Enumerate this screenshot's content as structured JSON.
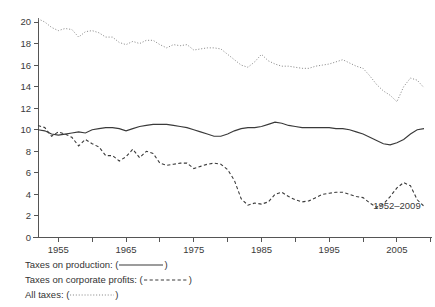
{
  "chart_data": {
    "type": "line",
    "title": "",
    "subtitle": "",
    "xlabel": "",
    "ylabel": "",
    "xlim": [
      1952,
      2009
    ],
    "ylim": [
      0,
      20
    ],
    "xticks": [
      1955,
      1965,
      1975,
      1985,
      1995,
      2005
    ],
    "yticks": [
      0,
      2,
      4,
      6,
      8,
      10,
      12,
      14,
      16,
      18,
      20
    ],
    "grid": false,
    "legend_position": "below-axes-left",
    "annotations": [
      {
        "text": "1952–2009",
        "x": 2005,
        "y": 2.6
      }
    ],
    "x": [
      1952,
      1953,
      1954,
      1955,
      1956,
      1957,
      1958,
      1959,
      1960,
      1961,
      1962,
      1963,
      1964,
      1965,
      1966,
      1967,
      1968,
      1969,
      1970,
      1971,
      1972,
      1973,
      1974,
      1975,
      1976,
      1977,
      1978,
      1979,
      1980,
      1981,
      1982,
      1983,
      1984,
      1985,
      1986,
      1987,
      1988,
      1989,
      1990,
      1991,
      1992,
      1993,
      1994,
      1995,
      1996,
      1997,
      1998,
      1999,
      2000,
      2001,
      2002,
      2003,
      2004,
      2005,
      2006,
      2007,
      2008,
      2009
    ],
    "series": [
      {
        "name": "Taxes on production",
        "style": "solid",
        "values": [
          10.0,
          9.9,
          9.6,
          9.5,
          9.6,
          9.7,
          9.8,
          9.7,
          10.0,
          10.1,
          10.2,
          10.2,
          10.1,
          9.9,
          10.1,
          10.3,
          10.4,
          10.5,
          10.5,
          10.5,
          10.4,
          10.3,
          10.2,
          10.0,
          9.8,
          9.6,
          9.4,
          9.4,
          9.6,
          9.9,
          10.1,
          10.2,
          10.2,
          10.3,
          10.5,
          10.7,
          10.6,
          10.4,
          10.3,
          10.2,
          10.2,
          10.2,
          10.2,
          10.2,
          10.1,
          10.1,
          10.0,
          9.8,
          9.6,
          9.3,
          9.0,
          8.7,
          8.6,
          8.8,
          9.1,
          9.6,
          10.0,
          10.1
        ]
      },
      {
        "name": "Taxes on corporate profits",
        "style": "dashed",
        "values": [
          10.4,
          10.2,
          9.4,
          9.8,
          9.6,
          9.3,
          8.5,
          9.1,
          8.7,
          8.4,
          7.6,
          7.6,
          7.1,
          7.5,
          8.2,
          7.4,
          8.0,
          7.8,
          6.9,
          6.7,
          6.8,
          6.9,
          6.9,
          6.4,
          6.6,
          6.8,
          6.9,
          6.8,
          6.3,
          5.3,
          3.6,
          3.0,
          3.2,
          3.1,
          3.3,
          4.0,
          4.2,
          3.8,
          3.5,
          3.3,
          3.4,
          3.7,
          4.0,
          4.1,
          4.2,
          4.2,
          4.0,
          3.8,
          3.7,
          3.2,
          2.8,
          3.1,
          3.8,
          4.6,
          5.1,
          4.8,
          3.5,
          2.9
        ]
      },
      {
        "name": "All taxes",
        "style": "dotted",
        "values": [
          20.3,
          20.0,
          19.5,
          19.2,
          19.4,
          19.3,
          18.6,
          19.1,
          19.2,
          19.0,
          18.6,
          18.6,
          18.1,
          17.9,
          18.2,
          18.0,
          18.3,
          18.3,
          17.9,
          17.6,
          17.9,
          17.8,
          17.9,
          17.4,
          17.5,
          17.6,
          17.6,
          17.5,
          17.0,
          16.5,
          16.0,
          15.8,
          16.3,
          17.0,
          16.4,
          16.1,
          15.9,
          15.9,
          15.8,
          15.7,
          15.7,
          15.9,
          16.0,
          16.1,
          16.3,
          16.5,
          16.2,
          15.9,
          15.7,
          15.0,
          14.2,
          13.6,
          13.2,
          12.6,
          14.0,
          14.8,
          14.6,
          13.9
        ]
      }
    ]
  },
  "legend": {
    "rows": [
      {
        "label_prefix": "Taxes on production: (",
        "label_suffix": ")",
        "style": "solid"
      },
      {
        "label_prefix": "Taxes on corporate profits: (",
        "label_suffix": ")",
        "style": "dashed"
      },
      {
        "label_prefix": "All taxes: (",
        "label_suffix": ")",
        "style": "dotted"
      }
    ]
  }
}
